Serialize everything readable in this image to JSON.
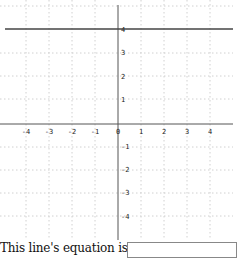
{
  "graph": {
    "x_ticks": [
      "-4",
      "-3",
      "-2",
      "-1",
      "0",
      "1",
      "2",
      "3",
      "4"
    ],
    "y_ticks_pos": [
      "4",
      "3",
      "2",
      "1"
    ],
    "y_ticks_neg": [
      "-1",
      "-2",
      "-3",
      "-4"
    ],
    "line": {
      "equation_shown": "y = 4",
      "color": "#444444"
    },
    "grid_color": "#cccccc",
    "axis_color": "#555555"
  },
  "question": {
    "prompt": "This line's equation is",
    "answer_value": "",
    "answer_placeholder": ""
  }
}
